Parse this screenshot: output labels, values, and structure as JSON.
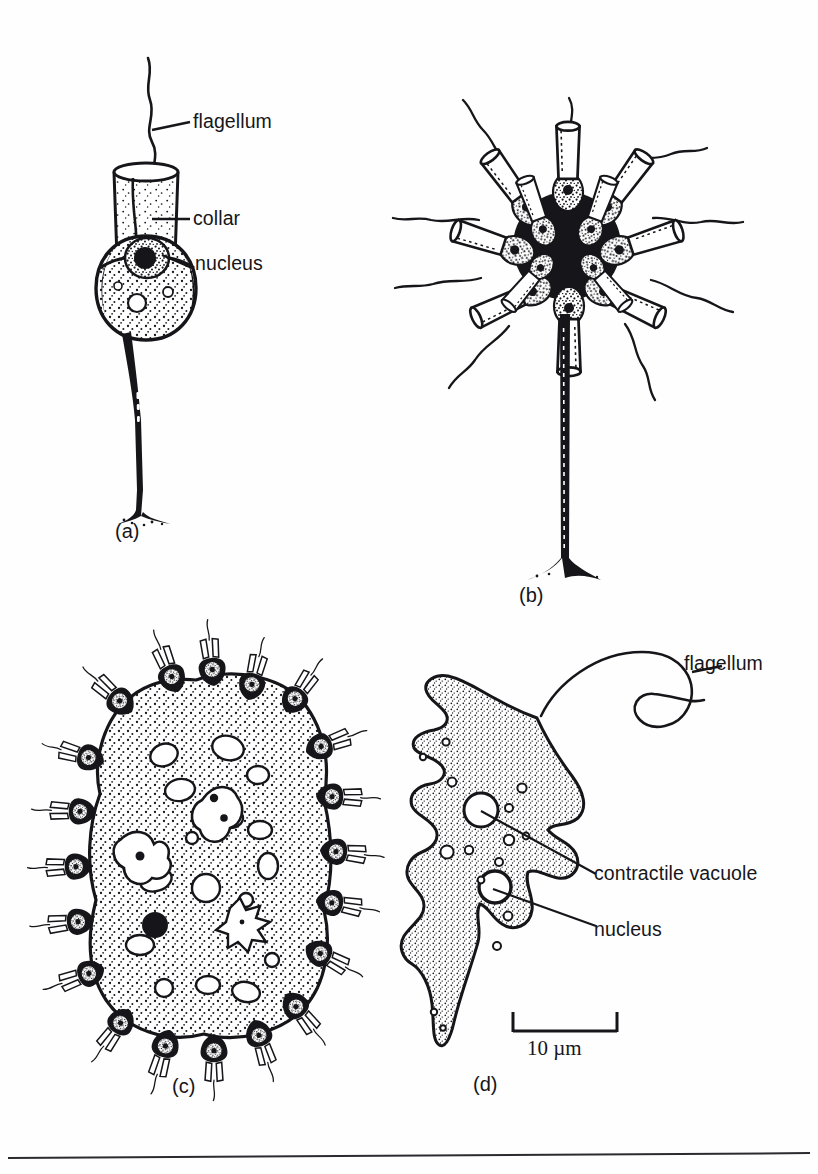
{
  "figure": {
    "kind": "scientific-line-drawing",
    "background_color": "#fefefe",
    "ink_color": "#16161a",
    "panel_count": 4
  },
  "panels": [
    {
      "id": "a",
      "caption": "(a)",
      "description": "solitary stalked collar flagellate",
      "labels": [
        {
          "text": "flagellum",
          "name": "label-flagellum-a"
        },
        {
          "text": "collar",
          "name": "label-collar-a"
        },
        {
          "text": "nucleus",
          "name": "label-nucleus-a"
        }
      ]
    },
    {
      "id": "b",
      "caption": "(b)",
      "description": "stalked rosette colony of collar flagellates",
      "labels": []
    },
    {
      "id": "c",
      "caption": "(c)",
      "description": "gelatinous colony with embedded collar flagellates",
      "labels": []
    },
    {
      "id": "d",
      "caption": "(d)",
      "description": "amoeboid flagellate with lobose pseudopodia",
      "labels": [
        {
          "text": "flagellum",
          "name": "label-flagellum-d"
        },
        {
          "text": "contractile vacuole",
          "name": "label-contractile-vacuole-d"
        },
        {
          "text": "nucleus",
          "name": "label-nucleus-d"
        }
      ]
    }
  ],
  "scale_bar": {
    "text": "10 µm",
    "value": 10,
    "unit": "µm"
  }
}
